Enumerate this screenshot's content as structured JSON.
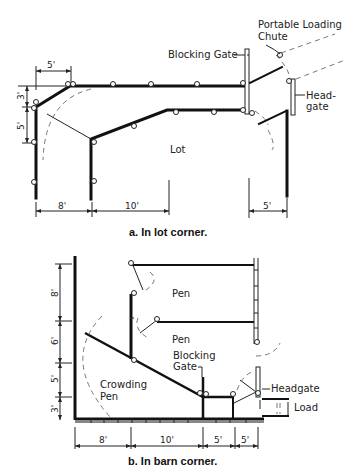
{
  "figure_a": {
    "caption": "a. In lot corner.",
    "labels": {
      "blocking_gate": "Blocking Gate",
      "chute_line1": "Portable Loading",
      "chute_line2": "Chute",
      "headgate_line1": "Head-",
      "headgate_line2": "gate",
      "lot": "Lot"
    },
    "dimensions": {
      "top": "5'",
      "left_upper": "3'",
      "left_lower": "5'",
      "bottom_left": "8'",
      "bottom_mid": "10'",
      "bottom_right": "5'"
    }
  },
  "figure_b": {
    "caption": "b. In barn corner.",
    "labels": {
      "pen_upper": "Pen",
      "pen_lower": "Pen",
      "blocking_line1": "Blocking",
      "blocking_line2": "Gate",
      "crowding_line1": "Crowding",
      "crowding_line2": "Pen",
      "headgate": "Headgate",
      "load": "Load"
    },
    "dimensions": {
      "left_8": "8'",
      "left_6": "6'",
      "left_5": "5'",
      "left_3": "3'",
      "bottom_8": "8'",
      "bottom_10": "10'",
      "bottom_5a": "5'",
      "bottom_5b": "5'"
    }
  }
}
